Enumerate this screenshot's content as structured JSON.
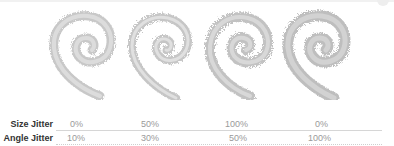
{
  "figure": {
    "samples": [
      {
        "size_jitter": "0%",
        "angle_jitter": "10%"
      },
      {
        "size_jitter": "50%",
        "angle_jitter": "30%"
      },
      {
        "size_jitter": "100%",
        "angle_jitter": "50%"
      },
      {
        "size_jitter": "0%",
        "angle_jitter": "100%"
      }
    ]
  },
  "table": {
    "rows": [
      {
        "label": "Size Jitter",
        "values": [
          "0%",
          "50%",
          "100%",
          "0%"
        ]
      },
      {
        "label": "Angle Jitter",
        "values": [
          "10%",
          "30%",
          "50%",
          "100%"
        ]
      }
    ]
  },
  "colors": {
    "stroke": "#c4c4c4",
    "label": "#333333",
    "value": "#9a9a9a"
  }
}
